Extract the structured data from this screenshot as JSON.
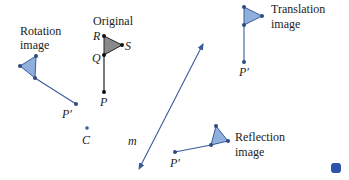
{
  "colors": {
    "blue": "#3a5a9c",
    "blue_fill": "#8fb0dc",
    "black": "#111111",
    "gray_fill": "#8a8a8a"
  },
  "labels": {
    "original": "Original",
    "rotation_line1": "Rotation",
    "rotation_line2": "image",
    "translation_line1": "Translation",
    "translation_line2": "image",
    "reflection_line1": "Reflection",
    "reflection_line2": "image",
    "R": "R",
    "S": "S",
    "Q": "Q",
    "P": "P",
    "P_prime_rotation": "P′",
    "P_prime_translation": "P′",
    "P_prime_reflection": "P′",
    "C": "C",
    "m": "m"
  }
}
